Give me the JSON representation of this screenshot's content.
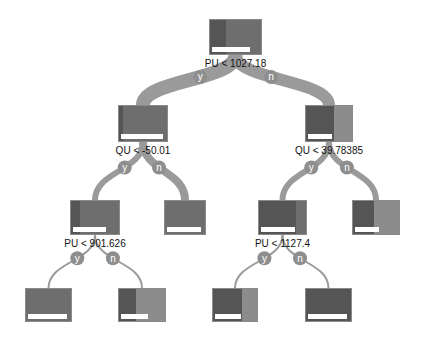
{
  "tree": {
    "edge_labels": {
      "yes": "y",
      "no": "n"
    },
    "colors": {
      "dark": "#555555",
      "mid": "#6e6e6e",
      "light": "#8c8c8c",
      "edge": "#9a9a9a",
      "edge_badge": "#8e8e8e"
    },
    "nodes": [
      {
        "id": "root",
        "x": 209,
        "y": 19,
        "w": 53,
        "h": 36,
        "split": "PU < 1027.18",
        "label_y": 58,
        "segments": [
          {
            "w": 0.32,
            "c": "dark"
          },
          {
            "w": 0.68,
            "c": "mid"
          }
        ],
        "bar": 0.78
      },
      {
        "id": "n1",
        "x": 118,
        "y": 105,
        "w": 50,
        "h": 37,
        "split": "QU < -50.01",
        "label_y": 145,
        "segments": [
          {
            "w": 0.08,
            "c": "dark"
          },
          {
            "w": 0.92,
            "c": "mid"
          }
        ],
        "bar": 0.92
      },
      {
        "id": "n2",
        "x": 305,
        "y": 105,
        "w": 48,
        "h": 37,
        "split": "QU < 39.78385",
        "label_y": 145,
        "segments": [
          {
            "w": 0.6,
            "c": "dark"
          },
          {
            "w": 0.4,
            "c": "light"
          }
        ],
        "bar": 0.55
      },
      {
        "id": "n3",
        "x": 70,
        "y": 200,
        "w": 50,
        "h": 35,
        "split": "PU < 901.626",
        "label_y": 238,
        "segments": [
          {
            "w": 0.18,
            "c": "dark"
          },
          {
            "w": 0.82,
            "c": "mid"
          }
        ],
        "bar": 0.72
      },
      {
        "id": "n4",
        "x": 164,
        "y": 200,
        "w": 42,
        "h": 35,
        "split": "",
        "segments": [
          {
            "w": 1.0,
            "c": "mid"
          }
        ],
        "bar": 0.9
      },
      {
        "id": "n5",
        "x": 258,
        "y": 200,
        "w": 49,
        "h": 35,
        "split": "PU < 1127.4",
        "label_y": 238,
        "segments": [
          {
            "w": 0.78,
            "c": "dark"
          },
          {
            "w": 0.22,
            "c": "mid"
          }
        ],
        "bar": 0.75
      },
      {
        "id": "n6",
        "x": 352,
        "y": 200,
        "w": 48,
        "h": 35,
        "split": "",
        "segments": [
          {
            "w": 0.45,
            "c": "dark"
          },
          {
            "w": 0.55,
            "c": "light"
          }
        ],
        "bar": 0.55
      },
      {
        "id": "n7",
        "x": 25,
        "y": 288,
        "w": 47,
        "h": 34,
        "split": "",
        "segments": [
          {
            "w": 1.0,
            "c": "mid"
          }
        ],
        "bar": 0.9
      },
      {
        "id": "n8",
        "x": 118,
        "y": 288,
        "w": 48,
        "h": 34,
        "split": "",
        "segments": [
          {
            "w": 0.38,
            "c": "dark"
          },
          {
            "w": 0.62,
            "c": "light"
          }
        ],
        "bar": 0.62
      },
      {
        "id": "n9",
        "x": 212,
        "y": 288,
        "w": 46,
        "h": 34,
        "split": "",
        "segments": [
          {
            "w": 0.65,
            "c": "dark"
          },
          {
            "w": 0.35,
            "c": "light"
          }
        ],
        "bar": 0.62
      },
      {
        "id": "n10",
        "x": 305,
        "y": 288,
        "w": 47,
        "h": 34,
        "split": "",
        "segments": [
          {
            "w": 1.0,
            "c": "dark"
          }
        ],
        "bar": 0.9
      }
    ],
    "edges": [
      {
        "from": "root",
        "to": "n1",
        "label": "y",
        "width": 14
      },
      {
        "from": "root",
        "to": "n2",
        "label": "n",
        "width": 12
      },
      {
        "from": "n1",
        "to": "n3",
        "label": "y",
        "width": 6
      },
      {
        "from": "n1",
        "to": "n4",
        "label": "n",
        "width": 8
      },
      {
        "from": "n2",
        "to": "n5",
        "label": "y",
        "width": 6
      },
      {
        "from": "n2",
        "to": "n6",
        "label": "n",
        "width": 6
      },
      {
        "from": "n3",
        "to": "n7",
        "label": "y",
        "width": 2
      },
      {
        "from": "n3",
        "to": "n8",
        "label": "n",
        "width": 2
      },
      {
        "from": "n5",
        "to": "n9",
        "label": "y",
        "width": 2
      },
      {
        "from": "n5",
        "to": "n10",
        "label": "n",
        "width": 2
      }
    ]
  }
}
